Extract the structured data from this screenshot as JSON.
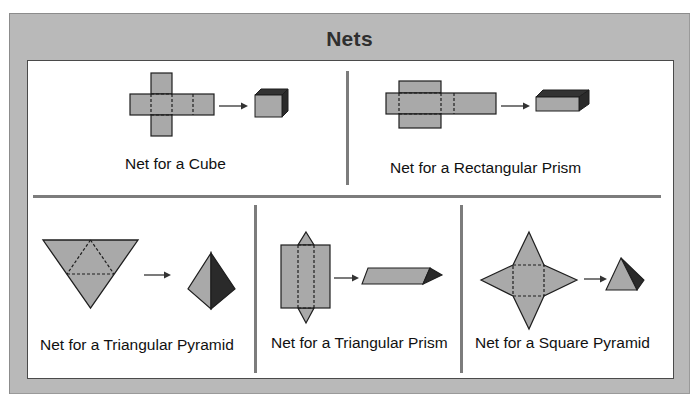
{
  "title": "Nets",
  "colors": {
    "panel": "#b9b9b9",
    "face_fill": "#a9a9a9",
    "face_dark": "#2e2e2e",
    "stroke": "#1e1e1e",
    "divider": "#7c7c7c"
  },
  "nets": [
    {
      "id": "cube",
      "label": "Net for a Cube"
    },
    {
      "id": "rectangular-prism",
      "label": "Net for a Rectangular Prism"
    },
    {
      "id": "triangular-pyramid",
      "label": "Net for a Triangular Pyramid"
    },
    {
      "id": "triangular-prism",
      "label": "Net for a Triangular Prism"
    },
    {
      "id": "square-pyramid",
      "label": "Net for a Square Pyramid"
    }
  ]
}
